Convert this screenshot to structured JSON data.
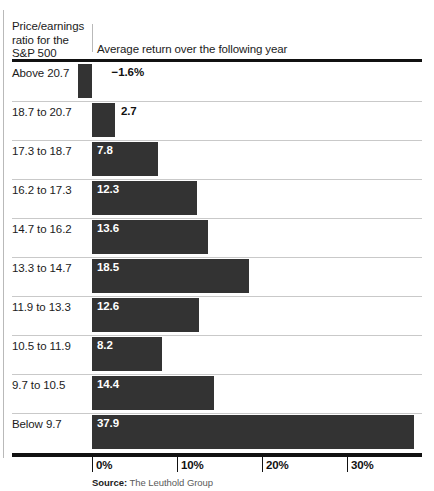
{
  "header": {
    "row_header": "Price/earnings ratio for the S&P 500",
    "subtitle": "Average return over the following year"
  },
  "footer": {
    "source_label": "Source:",
    "source_name": "The Leuthold Group"
  },
  "axis": {
    "ticks": [
      {
        "label": "0%",
        "value": 0
      },
      {
        "label": "10%",
        "value": 10
      },
      {
        "label": "20%",
        "value": 20
      },
      {
        "label": "30%",
        "value": 30
      }
    ]
  },
  "chart_data": {
    "type": "bar",
    "orientation": "horizontal",
    "title": "Price/earnings ratio for the S&P 500",
    "subtitle": "Average return over the following year",
    "xlabel": "Average return over the following year",
    "ylabel": "Price/earnings ratio for the S&P 500",
    "xlim": [
      -2,
      38
    ],
    "xticks": [
      0,
      10,
      20,
      30
    ],
    "xtick_labels": [
      "0%",
      "10%",
      "20%",
      "30%"
    ],
    "grid": false,
    "legend": null,
    "source": "The Leuthold Group",
    "categories": [
      "Above 20.7",
      "18.7 to 20.7",
      "17.3 to 18.7",
      "16.2 to 17.3",
      "14.7 to 16.2",
      "13.3 to 14.7",
      "11.9 to 13.3",
      "10.5 to 11.9",
      "9.7 to 10.5",
      "Below 9.7"
    ],
    "values": [
      -1.6,
      2.7,
      7.8,
      12.3,
      13.6,
      18.5,
      12.6,
      8.2,
      14.4,
      37.9
    ],
    "value_labels": [
      "−1.6%",
      "2.7",
      "7.8",
      "12.3",
      "13.6",
      "18.5",
      "12.6",
      "8.2",
      "14.4",
      "37.9"
    ],
    "bar_color": "#333333",
    "label_color_inside": "#ffffff",
    "label_color_outside": "#111111"
  }
}
